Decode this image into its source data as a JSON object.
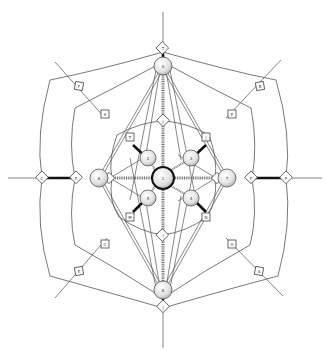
{
  "diagram": {
    "type": "spider-web network",
    "hub": {
      "label": "1"
    },
    "inner_nodes": [
      {
        "id": "n2",
        "label": "2",
        "position": "upper-left"
      },
      {
        "id": "n3",
        "label": "3",
        "position": "upper-right"
      },
      {
        "id": "n5",
        "label": "5",
        "position": "lower-left"
      },
      {
        "id": "n4",
        "label": "4",
        "position": "lower-right"
      }
    ],
    "axis_nodes": [
      {
        "id": "top",
        "label": "0",
        "position": "top"
      },
      {
        "id": "bottom",
        "label": "8",
        "position": "bottom"
      },
      {
        "id": "left",
        "label": "6",
        "position": "left"
      },
      {
        "id": "right",
        "label": "7",
        "position": "right"
      }
    ],
    "connectors": {
      "inner_diamonds": [
        "T",
        "J",
        "M",
        "N"
      ],
      "mid_diamonds": [
        "T",
        "J",
        "I",
        "J"
      ],
      "outer_diamonds": [
        "C",
        "E",
        "F",
        "P"
      ],
      "diagonal_boxes_inner": [
        "S",
        "E",
        "C",
        "H"
      ],
      "diagonal_boxes_outer": [
        "F",
        "B",
        "E",
        "A"
      ]
    },
    "colors": {
      "line": "#555555",
      "thick_link": "#111111",
      "node_fill": "#e6e6e6",
      "hub_stroke": "#111111"
    }
  }
}
